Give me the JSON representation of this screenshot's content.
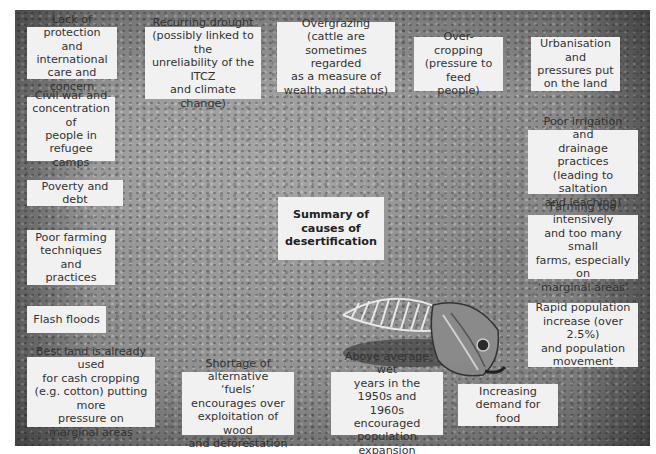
{
  "title": "Summary of\ncauses of\ndesertification",
  "background_image": "Photograph of a dried fish skeleton lying on cracked, gravelly desert ground",
  "causes": [
    {
      "id": "lack-of-protection",
      "text": "Lack of protection\nand international\ncare and concern"
    },
    {
      "id": "recurring-drought",
      "text": "Recurring drought\n(possibly linked to the\nunreliability of the ITCZ\nand climate change)"
    },
    {
      "id": "overgrazing",
      "text": "Overgrazing (cattle are\nsometimes regarded\nas a measure of\nwealth and status)"
    },
    {
      "id": "over-cropping",
      "text": "Over-cropping\n(pressure to feed\npeople)"
    },
    {
      "id": "urbanisation",
      "text": "Urbanisation and\npressures put\non the land"
    },
    {
      "id": "civil-war",
      "text": "Civil war and\nconcentration of\npeople in refugee\ncamps"
    },
    {
      "id": "poor-irrigation",
      "text": "Poor irrigation and\ndrainage practices\n(leading to saltation\nand leaching)"
    },
    {
      "id": "poverty-debt",
      "text": "Poverty and debt"
    },
    {
      "id": "poor-farming",
      "text": "Poor farming\ntechniques and\npractices"
    },
    {
      "id": "farming-intensively",
      "text": "Farming too intensively\nand too many small\nfarms, especially on\n‘marginal areas’"
    },
    {
      "id": "flash-floods",
      "text": "Flash floods"
    },
    {
      "id": "rapid-population",
      "text": "Rapid population\nincrease (over 2.5%)\nand population\nmovement"
    },
    {
      "id": "cash-cropping",
      "text": "Best land is already used\nfor cash cropping\n(e.g. cotton) putting more\npressure on marginal areas"
    },
    {
      "id": "alternative-fuels",
      "text": "Shortage of alternative\n‘fuels’ encourages over\nexploitation of wood\nand deforestation"
    },
    {
      "id": "wet-years",
      "text": "Above average wet\nyears in the 1950s and\n1960s encouraged\npopulation expansion"
    },
    {
      "id": "food-demand",
      "text": "Increasing\ndemand for food"
    }
  ]
}
